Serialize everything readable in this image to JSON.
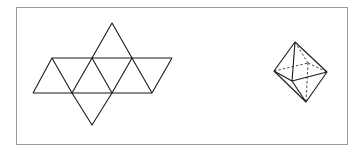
{
  "figure": {
    "frame": {
      "x": 16,
      "y": 7,
      "width": 331,
      "height": 137,
      "stroke": "#9a9a9a"
    },
    "line_color": "#1a1a1a",
    "net": {
      "label": "octahedron-net",
      "vertices": {
        "apex_top": [
          112,
          23
        ],
        "u1": [
          52,
          58
        ],
        "u2": [
          92,
          58
        ],
        "u3": [
          132,
          58
        ],
        "u4": [
          172,
          58
        ],
        "l1": [
          33,
          93
        ],
        "l2": [
          72,
          93
        ],
        "l3": [
          112,
          93
        ],
        "l4": [
          152,
          93
        ],
        "apex_bottom": [
          92,
          125
        ]
      }
    },
    "solid": {
      "label": "octahedron",
      "vertices": {
        "top": [
          295,
          42
        ],
        "left": [
          274,
          71
        ],
        "right": [
          327,
          72
        ],
        "front": [
          292,
          81
        ],
        "back": [
          308,
          63
        ],
        "bottom": [
          306,
          102
        ]
      },
      "hidden_edges": [
        "left-back",
        "back-right",
        "top-back",
        "back-bottom"
      ]
    }
  }
}
